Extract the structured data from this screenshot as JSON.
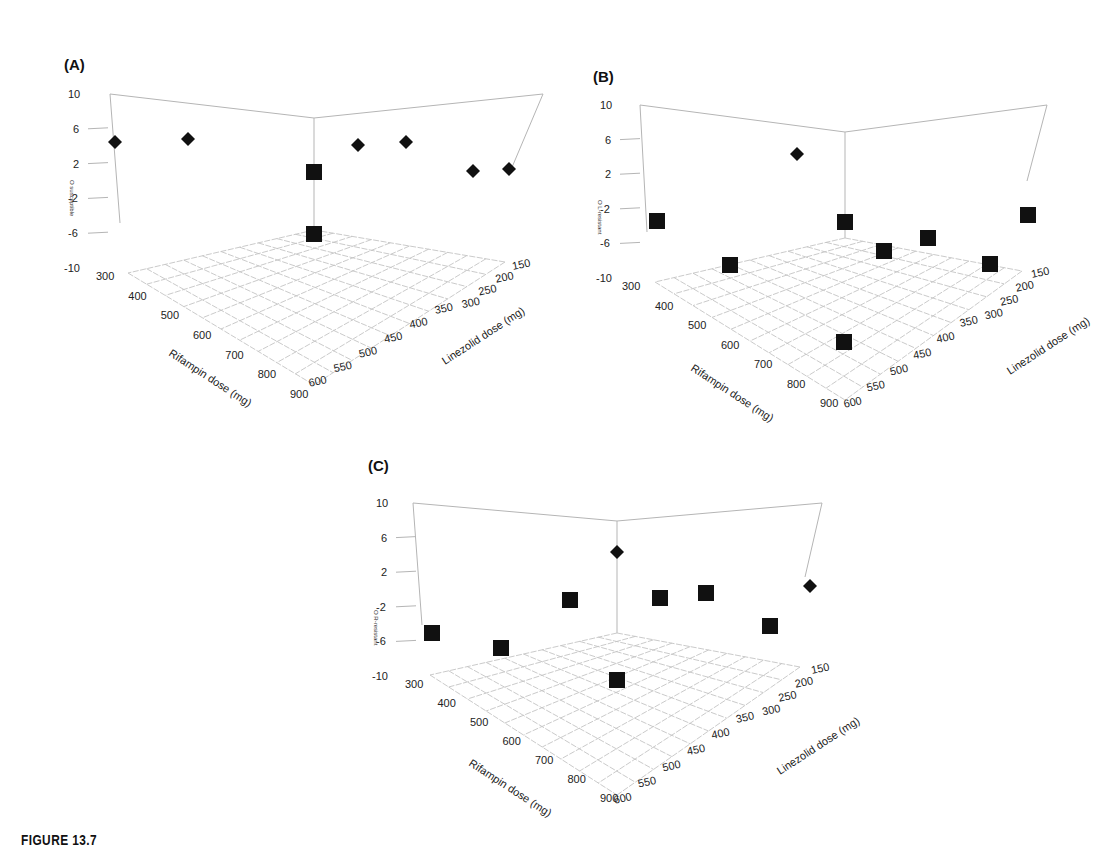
{
  "figure": {
    "caption": "FIGURE 13.7"
  },
  "chart_data": [
    {
      "panel": "(A)",
      "type": "scatter",
      "subtype": "3d-scatter",
      "xlabel": "Rifampin dose (mg)",
      "ylabel": "Linezolid dose (mg)",
      "zlabel": "O_susceptible",
      "x_ticks": [
        "300",
        "400",
        "500",
        "600",
        "700",
        "800",
        "900"
      ],
      "y_ticks": [
        "150",
        "200",
        "250",
        "300",
        "350",
        "400",
        "450",
        "500",
        "550",
        "600"
      ],
      "z_ticks": [
        "10",
        "6",
        "2",
        "-2",
        "-6",
        "-10"
      ],
      "zlim": [
        -10,
        10
      ],
      "markers": {
        "diamond": "upper points",
        "square": "lower points"
      },
      "points": [
        {
          "marker": "diamond",
          "z": 5.0
        },
        {
          "marker": "diamond",
          "z": 5.2
        },
        {
          "marker": "square",
          "z": 1.5
        },
        {
          "marker": "diamond",
          "z": 4.5
        },
        {
          "marker": "diamond",
          "z": 5.0
        },
        {
          "marker": "diamond",
          "z": 1.8
        },
        {
          "marker": "diamond",
          "z": 2.0
        },
        {
          "marker": "square",
          "z": -5.7
        }
      ]
    },
    {
      "panel": "(B)",
      "type": "scatter",
      "subtype": "3d-scatter",
      "xlabel": "Rifampin dose (mg)",
      "ylabel": "Linezolid dose (mg)",
      "zlabel": "O_L-resistant",
      "x_ticks": [
        "300",
        "400",
        "500",
        "600",
        "700",
        "800",
        "900"
      ],
      "y_ticks": [
        "150",
        "200",
        "250",
        "300",
        "350",
        "400",
        "450",
        "500",
        "550",
        "600"
      ],
      "z_ticks": [
        "10",
        "6",
        "2",
        "-2",
        "-6",
        "-10"
      ],
      "zlim": [
        -10,
        10
      ],
      "points": [
        {
          "marker": "square",
          "z": -2.5
        },
        {
          "marker": "diamond",
          "z": 5.0
        },
        {
          "marker": "square",
          "z": -2.7
        },
        {
          "marker": "square",
          "z": -2.0
        },
        {
          "marker": "square",
          "z": -8.5
        },
        {
          "marker": "square",
          "z": -7.5
        },
        {
          "marker": "square",
          "z": -6.5
        },
        {
          "marker": "square",
          "z": -8.0
        },
        {
          "marker": "square",
          "z": -10.0
        }
      ]
    },
    {
      "panel": "(C)",
      "type": "scatter",
      "subtype": "3d-scatter",
      "xlabel": "Rifampin dose (mg)",
      "ylabel": "Linezolid dose (mg)",
      "zlabel": "O_R-resistant",
      "x_ticks": [
        "300",
        "400",
        "500",
        "600",
        "700",
        "800",
        "900"
      ],
      "y_ticks": [
        "150",
        "200",
        "250",
        "300",
        "350",
        "400",
        "450",
        "500",
        "550",
        "600"
      ],
      "z_ticks": [
        "10",
        "6",
        "2",
        "-2",
        "-6",
        "-10"
      ],
      "zlim": [
        -10,
        10
      ],
      "points": [
        {
          "marker": "square",
          "z": -4.8
        },
        {
          "marker": "square",
          "z": -6.5
        },
        {
          "marker": "square",
          "z": -1.0
        },
        {
          "marker": "diamond",
          "z": 5.0
        },
        {
          "marker": "square",
          "z": -0.8
        },
        {
          "marker": "square",
          "z": -0.3
        },
        {
          "marker": "square",
          "z": -3.8
        },
        {
          "marker": "diamond",
          "z": 1.5
        },
        {
          "marker": "square",
          "z": -10.0
        }
      ]
    }
  ],
  "panels": {
    "a": {
      "label": "(A)",
      "zlabel": "O susceptible"
    },
    "b": {
      "label": "(B)",
      "zlabel": "O L-resistant"
    },
    "c": {
      "label": "(C)",
      "zlabel": "O R-resistant"
    }
  }
}
